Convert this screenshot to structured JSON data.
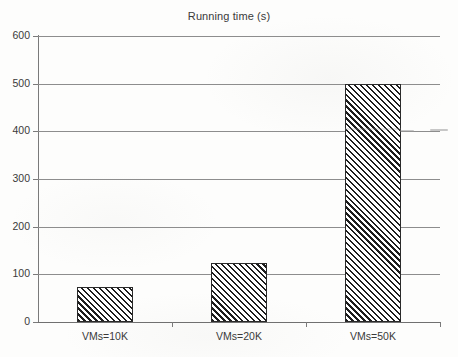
{
  "chart_data": {
    "type": "bar",
    "title": "Running time (s)",
    "xlabel": "",
    "ylabel": "",
    "categories": [
      "VMs=10K",
      "VMs=20K",
      "VMs=50K"
    ],
    "values": [
      73,
      124,
      500
    ],
    "ylim": [
      0,
      600
    ],
    "yticks": [
      0,
      100,
      200,
      300,
      400,
      500,
      600
    ],
    "ytick_labels": [
      "0",
      "100",
      "200",
      "300",
      "400",
      "500",
      "600"
    ],
    "grid": true,
    "legend": "none",
    "series": [
      {
        "name": "Running time (s)",
        "values": [
          73,
          124,
          500
        ],
        "fill": "diagonal-hatch",
        "color": "#1d1d1d"
      }
    ]
  },
  "figure": {
    "title": "Running time (s)",
    "background_color": "#fdfdfc",
    "axis_color": "#7a7a7a",
    "grid_color": "#8d8d8d",
    "text_color": "#3a3a3a",
    "bar_edge_color": "#2a2a2a",
    "bar_hatch_color": "#1d1d1d"
  }
}
